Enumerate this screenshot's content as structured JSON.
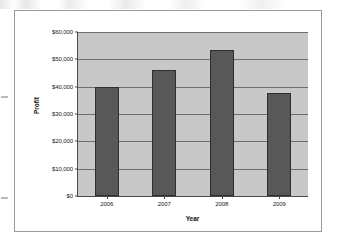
{
  "chart_data": {
    "type": "bar",
    "title": "",
    "categories": [
      "2006",
      "2007",
      "2008",
      "2009"
    ],
    "values": [
      40000,
      46000,
      53300,
      37800
    ],
    "xlabel": "Year",
    "ylabel": "Profit",
    "ylim": [
      0,
      60000
    ],
    "ytick_values": [
      0,
      10000,
      20000,
      30000,
      40000,
      50000,
      60000
    ],
    "ytick_labels": [
      "$0",
      "$10,000",
      "$20,000",
      "$30,000",
      "$40,000",
      "$50,000",
      "$60,000"
    ],
    "grid": true,
    "legend": false,
    "legend_position": "none",
    "colors": {
      "bar_fill": "#585858",
      "bar_outline": "#2e2e2e",
      "plot_background": "#c8c8c8",
      "gridline": "#6e6e6e",
      "axis_line": "#4a4a4a",
      "frame_border": "#9a9a9a",
      "text": "#1a1a1a"
    }
  }
}
